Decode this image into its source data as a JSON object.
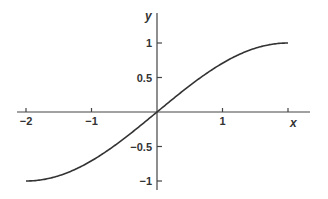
{
  "chart_data": {
    "type": "line",
    "title": "",
    "xlabel": "x",
    "ylabel": "y",
    "xlim": [
      -2,
      2
    ],
    "ylim": [
      -1,
      1
    ],
    "grid": false,
    "legend": null,
    "x_ticks": [
      -2,
      -1,
      1,
      2
    ],
    "x_tick_labels": [
      "−2",
      "−1",
      "1",
      ""
    ],
    "y_ticks": [
      1,
      0.5,
      -0.5,
      -1
    ],
    "y_tick_labels": [
      "1",
      "0.5",
      "−0.5",
      "−1"
    ],
    "series": [
      {
        "name": "y = sin(πx/4)",
        "x": [
          -2,
          -1.75,
          -1.5,
          -1.25,
          -1,
          -0.75,
          -0.5,
          -0.25,
          0,
          0.25,
          0.5,
          0.75,
          1,
          1.25,
          1.5,
          1.75,
          2
        ],
        "y": [
          -1,
          -0.981,
          -0.924,
          -0.831,
          -0.707,
          -0.556,
          -0.383,
          -0.195,
          0,
          0.195,
          0.383,
          0.556,
          0.707,
          0.831,
          0.924,
          0.981,
          1
        ]
      }
    ],
    "colors": {
      "axis": "#444444",
      "curve": "#333333",
      "text": "#333333"
    }
  },
  "layout": {
    "origin_px": [
      157,
      112
    ],
    "x_unit_px": 65.5,
    "y_unit_px": 69,
    "x_axis_extent_px": [
      17,
      310
    ],
    "y_axis_extent_px": [
      13,
      190
    ]
  }
}
